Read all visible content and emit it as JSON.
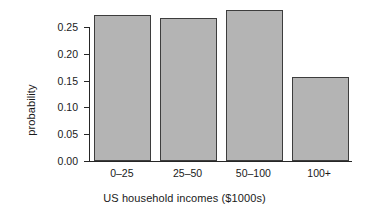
{
  "chart_data": {
    "type": "bar",
    "title": "",
    "subtitle": "",
    "xlabel": "US household incomes ($1000s)",
    "ylabel": "probability",
    "categories": [
      "0–25",
      "25–50",
      "50–100",
      "100+"
    ],
    "values": [
      0.272,
      0.267,
      0.282,
      0.157
    ],
    "ylim": [
      0.0,
      0.2825
    ],
    "xlim": [
      0,
      4
    ],
    "yticks": [
      0.0,
      0.05,
      0.1,
      0.15,
      0.2,
      0.25
    ],
    "ytick_labels": [
      "0.00",
      "0.05",
      "0.10",
      "0.15",
      "0.20",
      "0.25"
    ],
    "grid": false,
    "legend": false,
    "legend_position": "none",
    "bar_fill_color": "#b4b4b4",
    "bar_border_color": "#3d3d3d",
    "axis_color": "#262626",
    "background_color": "#ffffff",
    "series": [
      {
        "name": "probability",
        "values": [
          0.272,
          0.267,
          0.282,
          0.157
        ]
      }
    ]
  },
  "axes": {
    "y_title": "probability",
    "x_title": "US household incomes ($1000s)"
  }
}
